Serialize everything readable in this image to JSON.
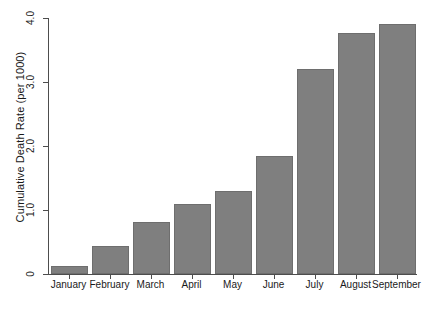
{
  "chart_data": {
    "type": "bar",
    "title": "",
    "subtitle": "",
    "xlabel": "",
    "ylabel": "Cumulative Death Rate (per 1000)",
    "categories": [
      "January",
      "February",
      "March",
      "April",
      "May",
      "June",
      "July",
      "August",
      "September"
    ],
    "values": [
      0.13,
      0.44,
      0.82,
      1.1,
      1.3,
      1.85,
      3.2,
      3.77,
      3.9
    ],
    "ylim": [
      0,
      4.0
    ],
    "y_ticks": [
      0,
      1.0,
      2.0,
      3.0,
      4.0
    ],
    "y_tick_labels": [
      "0",
      "1.0",
      "2.0",
      "3.0",
      "4.0"
    ],
    "grid": false,
    "legend": false,
    "legend_position": "none",
    "bar_color": "#7f7f7f",
    "bar_edge_color": "#6e6e6e",
    "axis_color": "#4d4d4d",
    "background_color": "#ffffff",
    "series": [
      {
        "name": "Cumulative Death Rate",
        "values": [
          0.13,
          0.44,
          0.82,
          1.1,
          1.3,
          1.85,
          3.2,
          3.77,
          3.9
        ]
      }
    ]
  }
}
